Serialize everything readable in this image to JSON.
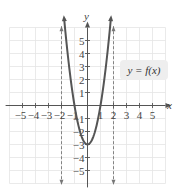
{
  "chart_data": {
    "type": "line",
    "title": "",
    "xlabel": "x",
    "ylabel": "y",
    "xlim": [
      -6,
      6
    ],
    "ylim": [
      -6,
      6
    ],
    "grid": true,
    "x_ticks": [
      -5,
      -4,
      -3,
      -2,
      -1,
      1,
      2,
      3,
      4,
      5
    ],
    "y_ticks": [
      -5,
      -4,
      -3,
      -2,
      -1,
      1,
      2,
      3,
      4,
      5
    ],
    "x_tick_labels": [
      "−5",
      "−4",
      "−3",
      "−2",
      "−1",
      "1",
      "2",
      "3",
      "4",
      "5"
    ],
    "y_tick_labels": [
      "−5",
      "−4",
      "−3",
      "−2",
      "−1",
      "1",
      "2",
      "3",
      "4",
      "5"
    ],
    "series": [
      {
        "name": "y = f(x)",
        "style": "solid",
        "color": "#555555",
        "points": [
          [
            -1.8,
            6.0
          ],
          [
            -1.5,
            3.75
          ],
          [
            -1.0,
            0
          ],
          [
            -0.5,
            -2.25
          ],
          [
            0,
            -3
          ],
          [
            0.5,
            -2.25
          ],
          [
            1.0,
            0
          ],
          [
            1.5,
            3.75
          ],
          [
            1.8,
            6.0
          ]
        ]
      }
    ],
    "asymptotes": [
      {
        "type": "vertical",
        "x": -2,
        "style": "dashed"
      },
      {
        "type": "vertical",
        "x": 2,
        "style": "dashed"
      }
    ],
    "annotations": [
      {
        "text": "y = f(x)",
        "position": "right, between y=2 and y=3"
      }
    ],
    "legend": "none"
  },
  "labels": {
    "x_axis": "x",
    "y_axis": "y",
    "function": "y = f(x)"
  },
  "colors": {
    "curve": "#555555",
    "grid": "#e4e4e4",
    "axis": "#555555",
    "label_box": "#eeeeee"
  }
}
